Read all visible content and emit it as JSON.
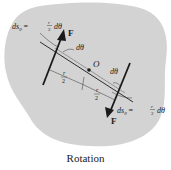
{
  "figure": {
    "caption": "Rotation",
    "colors": {
      "body_fill": "#d3d3d3",
      "line": "#1a1a1a",
      "background": "#ffffff"
    },
    "labels": {
      "force_top": "F",
      "force_bottom": "F",
      "origin": "O",
      "angle_top": "dθ",
      "angle_bottom": "dθ",
      "ds_top": "ds",
      "ds_top_sub": "θ",
      "ds_top_eq": "=",
      "ds_top_num": "r",
      "ds_top_den": "2",
      "ds_top_tail": "dθ",
      "ds_bottom": "ds",
      "ds_bottom_sub": "θ",
      "ds_bottom_eq": "=",
      "ds_bottom_num": "r",
      "ds_bottom_den": "2",
      "ds_bottom_tail": "dθ",
      "half_r_left_num": "r",
      "half_r_left_den": "2",
      "half_r_right_num": "r",
      "half_r_right_den": "2"
    }
  }
}
